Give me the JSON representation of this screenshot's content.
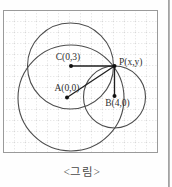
{
  "figure": {
    "caption": "<그림>",
    "points": {
      "C": {
        "label": "C(0,3)"
      },
      "P": {
        "label": "P(x,y)"
      },
      "A": {
        "label": "A(0,0)"
      },
      "B": {
        "label": "B(4,0)"
      }
    }
  },
  "colors": {
    "grid_stroke": "#c9c9c9",
    "frame_stroke": "#9a9a9a",
    "circle_stroke": "#4d4d4d",
    "segment_stroke": "#1f1f1f",
    "dot_fill": "#111111",
    "label_color": "#2f2f2f",
    "caption_color": "#4a4a4a",
    "page_edge": "#a3a3a3"
  }
}
